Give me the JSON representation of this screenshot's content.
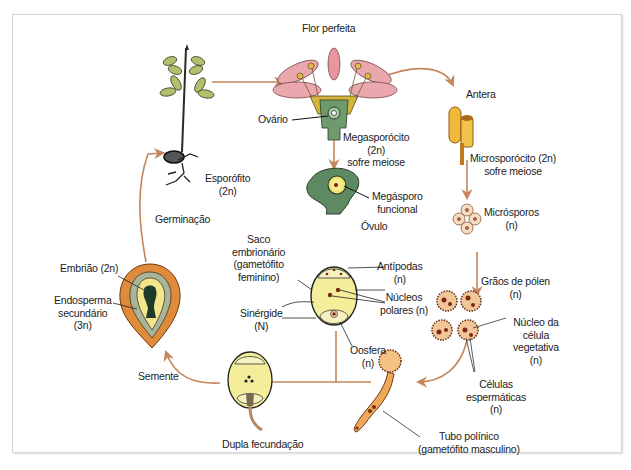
{
  "diagram": {
    "colors": {
      "arrow": "#c4865a",
      "petal": "#e9a3aa",
      "leaf": "#a7b56a",
      "pollen": "#b8642a",
      "seed_coat": "#e08a3c",
      "sac": "#f4ee9a",
      "ovule": "#5d8a62"
    },
    "stages": {
      "flor": {
        "label": "Flor perfeita"
      },
      "ovario": {
        "label": "Ovário"
      },
      "megasporocito": {
        "line1": "Megasporócito",
        "line2": "(2n)",
        "line3": "sofre meiose"
      },
      "megasporo": {
        "line1": "Megásporo",
        "line2": "funcional"
      },
      "ovulo": {
        "label": "Óvulo"
      },
      "antera": {
        "label": "Antera"
      },
      "microsporocito": {
        "line1": "Microsporócito (2n)",
        "line2": "sofre meiose"
      },
      "microsporos": {
        "line1": "Micrósporos",
        "line2": "(n)"
      },
      "graos_polen": {
        "line1": "Grãos de pólen",
        "line2": "(n)"
      },
      "nucleo_vegetativo": {
        "line1": "Núcleo da",
        "line2": "célula",
        "line3": "vegetativa",
        "line4": "(n)"
      },
      "celulas_espermaticas": {
        "line1": "Células",
        "line2": "espermáticas",
        "line3": "(n)"
      },
      "tubo_polinico": {
        "line1": "Tubo polínico",
        "line2": "(gametófito masculino)"
      },
      "saco": {
        "line1": "Saco",
        "line2": "embrionário",
        "line3": "(gametófito",
        "line4": "feminino)"
      },
      "antipodas": {
        "line1": "Antípodas",
        "line2": "(n)"
      },
      "nucleos_polares": {
        "line1": "Núcleos",
        "line2": "polares (n)"
      },
      "sinergide": {
        "line1": "Sinérgide",
        "line2": "(N)"
      },
      "oosfera": {
        "line1": "Oosfera",
        "line2": "(n)"
      },
      "dupla": {
        "label": "Dupla fecundação"
      },
      "semente": {
        "label": "Semente"
      },
      "embriao": {
        "label": "Embrião (2n)"
      },
      "endosperma": {
        "line1": "Endosperma",
        "line2": "secundário",
        "line3": "(3n)"
      },
      "germinacao": {
        "label": "Germinação"
      },
      "esporofito": {
        "line1": "Esporófito",
        "line2": "(2n)"
      }
    }
  }
}
